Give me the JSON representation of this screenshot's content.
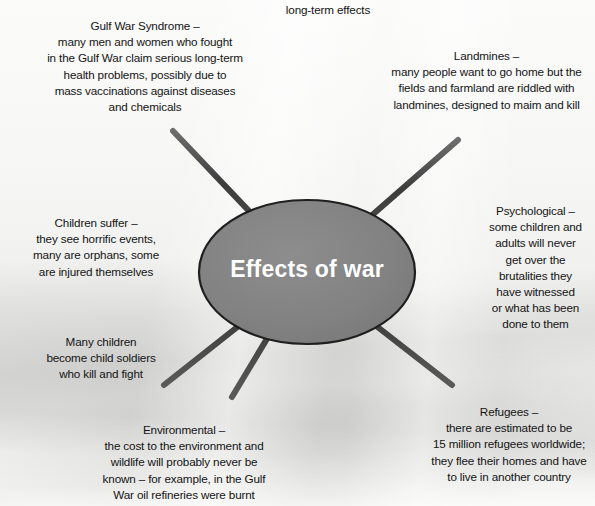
{
  "diagram": {
    "type": "spider-diagram",
    "title_label": "long-term effects",
    "hub": {
      "label": "Effects of war",
      "fill_color": "#808080",
      "stroke_color": "#1f1f1f",
      "text_color": "#ffffff"
    },
    "spoke_color": "#4a4a4a",
    "background_color": "#f2f2f0",
    "text_color": "#141414",
    "branches": [
      {
        "id": "gulf-war-syndrome",
        "heading": "Gulf War Syndrome –",
        "lines": [
          "many men and women who fought",
          "in the Gulf War claim serious long-term",
          "health problems, possibly due to",
          "mass vaccinations against diseases",
          "and chemicals"
        ],
        "direction": "north-west"
      },
      {
        "id": "landmines",
        "heading": "Landmines –",
        "lines": [
          "many people want to go home but the",
          "fields and farmland are riddled with",
          "landmines, designed to maim and kill"
        ],
        "direction": "north-east"
      },
      {
        "id": "psychological",
        "heading": "Psychological –",
        "lines": [
          "some children and",
          "adults will never",
          "get over the",
          "brutalities they",
          "have witnessed",
          "or what has been",
          "done to them"
        ],
        "direction": "east"
      },
      {
        "id": "refugees",
        "heading": "Refugees –",
        "lines": [
          "there are estimated to be",
          "15 million refugees worldwide;",
          "they flee their homes and have",
          "to live in another country"
        ],
        "direction": "south-east"
      },
      {
        "id": "environmental",
        "heading": "Environmental –",
        "lines": [
          "the cost to the environment and",
          "wildlife will probably never be",
          "known – for example, in the Gulf",
          "War oil refineries were burnt"
        ],
        "direction": "south"
      },
      {
        "id": "child-soldiers",
        "heading": "Many children",
        "lines": [
          "become child soldiers",
          "who kill and fight"
        ],
        "direction": "south-west"
      },
      {
        "id": "children-suffer",
        "heading": "Children suffer –",
        "lines": [
          "they see horrific events,",
          "many are orphans, some",
          "are injured themselves"
        ],
        "direction": "west"
      }
    ]
  }
}
